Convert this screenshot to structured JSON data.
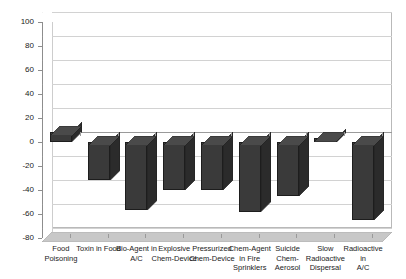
{
  "chart_data": {
    "type": "bar",
    "title": "",
    "subtitle": "",
    "xlabel": "",
    "ylabel": "",
    "ylim": [
      -80,
      100
    ],
    "ytick_step": 20,
    "yticks": [
      100,
      80,
      60,
      40,
      20,
      0,
      -20,
      -40,
      -60,
      -80
    ],
    "ytick_labels": [
      "100",
      "80",
      "60",
      "40",
      "20",
      "0",
      "-20",
      "-40",
      "-60",
      "-80"
    ],
    "grid": true,
    "legend": false,
    "legend_position": "none",
    "style": "3d-column",
    "bar_color": "#3a3a3a",
    "bar_side_color": "#2b2b2b",
    "bar_top_color": "#4a4a4a",
    "bar_edge_color": "#1d1d1d",
    "grid_color": "#d2d2d2",
    "axis_color": "#8d8d8d",
    "floor_color": "#c8c8c8",
    "plot_background": "#ffffff",
    "categories": [
      "Food Poisoning",
      "Toxin in Food",
      "Bio-Agent in A/C",
      "Explosive Chem-Device",
      "Pressurized Chem-Device",
      "Chem-Agent in Fire Sprinklers",
      "Suicide Chem-Aerosol",
      "Slow Radioactive Dispersal",
      "Radioactive in A/C"
    ],
    "category_lines": [
      [
        "Food",
        "Poisoning"
      ],
      [
        "Toxin in Food"
      ],
      [
        "Bio-Agent in",
        "A/C"
      ],
      [
        "Explosive",
        "Chem-Device"
      ],
      [
        "Pressurized",
        "Chem-Device"
      ],
      [
        "Chem-Agent",
        "in Fire",
        "Sprinklers"
      ],
      [
        "Suicide",
        "Chem-",
        "Aerosol"
      ],
      [
        "Slow",
        "Radioactive",
        "Dispersal"
      ],
      [
        "Radioactive in",
        "A/C"
      ]
    ],
    "values": [
      8,
      -32,
      -57,
      -40,
      -40,
      -58,
      -45,
      3,
      -65
    ],
    "series": [
      {
        "name": "Series 1",
        "values": [
          8,
          -32,
          -57,
          -40,
          -40,
          -58,
          -45,
          3,
          -65
        ]
      }
    ]
  }
}
